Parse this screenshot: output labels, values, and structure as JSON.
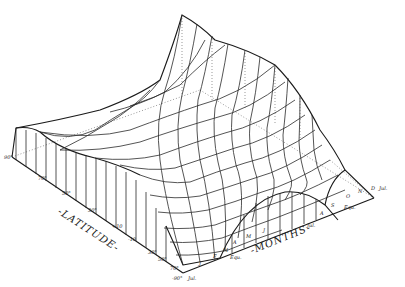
{
  "figure": {
    "type": "3d-wireframe-surface",
    "axes": {
      "latitude": {
        "title": "-LATITUDE-",
        "ticks": [
          "90°",
          "70°",
          "50°",
          "30°",
          "+10",
          "-10",
          "30°",
          "50°",
          "70°",
          "-90°"
        ]
      },
      "months": {
        "title": "-MONTHS-",
        "ticks": [
          "Jul.",
          "J",
          "F",
          "M",
          "Equ.",
          "A",
          "M",
          "J",
          "Jul.",
          "A",
          "S",
          "Equ.",
          "O",
          "N",
          "D",
          "Jul."
        ]
      }
    },
    "corner_labels": {
      "left": "90°",
      "bottom": "-90°",
      "bottom_month": "Jul.",
      "right_month": "Jul."
    }
  }
}
